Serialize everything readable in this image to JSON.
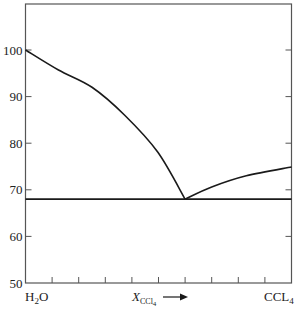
{
  "chart_data": {
    "type": "line",
    "title": "",
    "xlabel": "X_CCl4",
    "xlabel_main": "X",
    "xlabel_sub": "CCl",
    "xlabel_sub2": "4",
    "xlabel_arrow": "→",
    "ylabel": "",
    "xlim": [
      0,
      1
    ],
    "ylim": [
      50,
      110
    ],
    "yticks": [
      50,
      60,
      70,
      80,
      90,
      100
    ],
    "xticks_count": 10,
    "x_endpoints": {
      "left": "H2O",
      "left_main": "H",
      "left_sub": "2",
      "left_end": "O",
      "right": "CCL4",
      "right_main": "CCL",
      "right_sub": "4"
    },
    "grid": false,
    "legend": null,
    "series": [
      {
        "name": "H2O liquidus",
        "x": [
          0.0,
          0.124,
          0.25,
          0.373,
          0.497,
          0.6
        ],
        "y": [
          100,
          95.7,
          92.0,
          86.0,
          78.1,
          68
        ]
      },
      {
        "name": "CCl4 liquidus",
        "x": [
          0.6,
          0.7,
          0.83,
          1.0
        ],
        "y": [
          68,
          70.6,
          73.0,
          74.9
        ]
      },
      {
        "name": "eutectic line",
        "x": [
          0.0,
          1.0
        ],
        "y": [
          68,
          68
        ]
      }
    ],
    "colors": {
      "axis": "#555555",
      "curve": "#1a1a1a"
    }
  }
}
